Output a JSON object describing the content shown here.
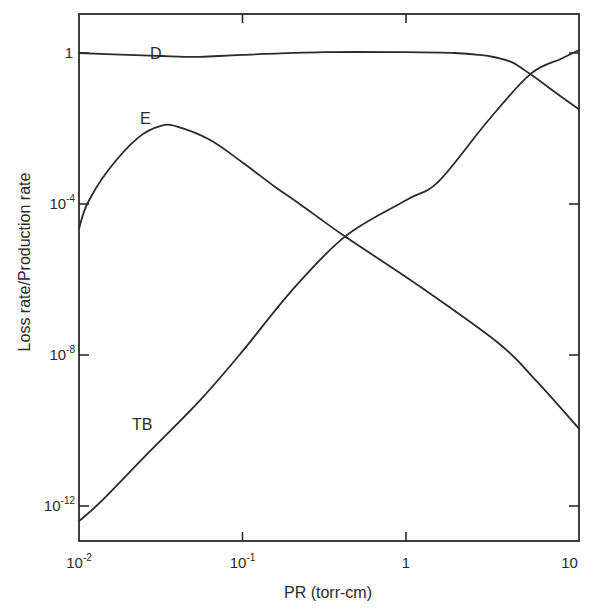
{
  "chart_data": {
    "type": "line",
    "title": "",
    "xlabel": "PR (torr-cm)",
    "ylabel": "Loss rate/Production rate",
    "xscale": "log",
    "yscale": "log",
    "xlim": [
      0.01,
      11.5
    ],
    "ylim": [
      1.2e-13,
      10.7
    ],
    "grid": false,
    "legend": "inline curve labels",
    "x_ticks": [
      {
        "value": 0.01,
        "base": "10",
        "exp": "-2"
      },
      {
        "value": 0.1,
        "base": "10",
        "exp": "-1"
      },
      {
        "value": 1,
        "base": "1",
        "exp": ""
      },
      {
        "value": 10,
        "base": "10",
        "exp": ""
      }
    ],
    "y_ticks": [
      {
        "value": 1,
        "base": "1",
        "exp": ""
      },
      {
        "value": 0.0001,
        "base": "10",
        "exp": "-4"
      },
      {
        "value": 1e-08,
        "base": "10",
        "exp": "-8"
      },
      {
        "value": 1e-12,
        "base": "10",
        "exp": "-12"
      }
    ],
    "series": [
      {
        "name": "D",
        "log10_x": [
          -2.0,
          -1.7,
          -1.5,
          -1.26,
          -1.0,
          -0.5,
          0.0,
          0.3,
          0.45,
          0.55,
          0.65,
          0.76,
          0.9,
          1.06
        ],
        "log10_y": [
          0.0,
          -0.05,
          -0.08,
          -0.1,
          -0.05,
          0.02,
          0.02,
          0.0,
          -0.05,
          -0.12,
          -0.25,
          -0.56,
          -1.0,
          -1.5
        ]
      },
      {
        "name": "E",
        "log10_x": [
          -2.0,
          -1.95,
          -1.82,
          -1.64,
          -1.5,
          -1.4,
          -1.2,
          -1.0,
          -0.8,
          -0.65,
          -0.37,
          0.09,
          0.57,
          0.8,
          1.06
        ],
        "log10_y": [
          -4.66,
          -4.0,
          -3.1,
          -2.25,
          -1.93,
          -1.95,
          -2.3,
          -2.9,
          -3.55,
          -4.0,
          -4.87,
          -6.2,
          -7.7,
          -8.7,
          -9.96
        ]
      },
      {
        "name": "TB",
        "log10_x": [
          -2.0,
          -1.87,
          -1.6,
          -1.26,
          -1.0,
          -0.7,
          -0.37,
          0.0,
          0.2,
          0.5,
          0.76,
          0.95,
          1.06
        ],
        "log10_y": [
          -12.4,
          -11.9,
          -10.7,
          -9.2,
          -7.9,
          -6.3,
          -4.85,
          -3.9,
          -3.4,
          -1.8,
          -0.56,
          -0.15,
          0.08
        ]
      }
    ]
  },
  "labels": {
    "curve_D": "D",
    "curve_E": "E",
    "curve_TB": "TB",
    "x_axis_title": "PR (torr-cm)",
    "y_axis_title": "Loss rate/Production rate"
  }
}
